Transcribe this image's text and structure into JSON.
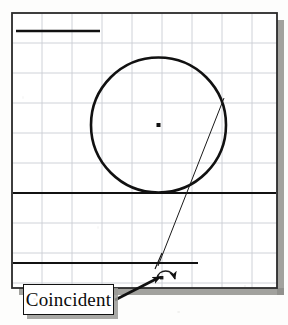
{
  "document": {
    "kind": "cad-sketch-figure",
    "title": "Coincident constraint sketch"
  },
  "drawing_frame": {
    "border_color": "#2b2b2b",
    "background_color": "#ffffff",
    "shadow_color": "#8d8d89",
    "x": 12,
    "y": 13,
    "width": 265,
    "height": 275
  },
  "grid": {
    "visible": true,
    "color": "#c9cdd4",
    "spacing_px": 30,
    "origin_x": 12,
    "origin_y": 13
  },
  "geometry": {
    "circle": {
      "name": "sketch-circle",
      "center_x": 158.5,
      "center_y": 125,
      "radius": 67.5,
      "stroke": "#111111",
      "stroke_width": 2.6,
      "center_point_visible": true,
      "center_point_size": 4
    },
    "lines": [
      {
        "name": "top-horizontal-line",
        "x1": 16,
        "y1": 31,
        "x2": 100,
        "y2": 31,
        "stroke": "#111111",
        "stroke_width": 2.4
      },
      {
        "name": "middle-horizontal-line",
        "x1": 13,
        "y1": 193,
        "x2": 276,
        "y2": 193,
        "stroke": "#111111",
        "stroke_width": 1.9
      },
      {
        "name": "bottom-horizontal-line",
        "x1": 13,
        "y1": 263,
        "x2": 198,
        "y2": 263,
        "stroke": "#111111",
        "stroke_width": 1.9
      },
      {
        "name": "diagonal-construction-line",
        "x1": 224,
        "y1": 98,
        "x2": 158,
        "y2": 266,
        "stroke": "#1a1a1a",
        "stroke_width": 1.0
      }
    ]
  },
  "cursor": {
    "name": "coincident-constraint-cursor",
    "crosshair_x": 158,
    "crosshair_y": 263,
    "symbol": "curved-arrow",
    "symbol_x": 166,
    "symbol_y": 275
  },
  "annotation": {
    "label": "Coincident",
    "box": {
      "x": 23,
      "y": 284,
      "width": 91,
      "height": 31
    },
    "shadow_offset": 4,
    "leader_arrow": {
      "name": "callout-leader-arrow",
      "from_x": 115,
      "from_y": 300,
      "to_x": 160,
      "to_y": 277
    }
  }
}
